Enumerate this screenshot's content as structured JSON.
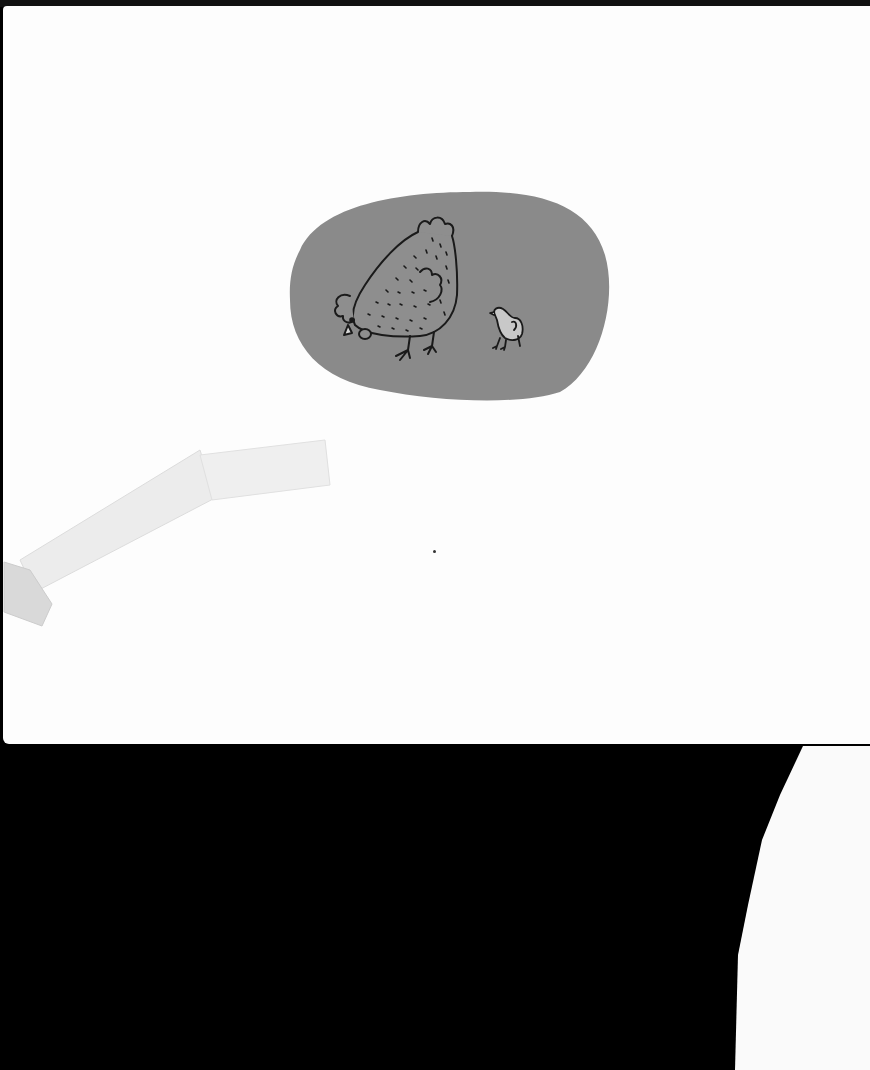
{
  "scan": {
    "background_color": "#000000",
    "page_color": "#fdfdfd",
    "blob_color": "#8a8a8a",
    "hen_fill": "#8e8e8e",
    "chick_fill": "#c8c8c8",
    "line_color": "#1a1a1a",
    "tape_color": "#ededed"
  },
  "illustration": {
    "subjects": [
      "hen-pecking",
      "chick"
    ],
    "text": ""
  }
}
